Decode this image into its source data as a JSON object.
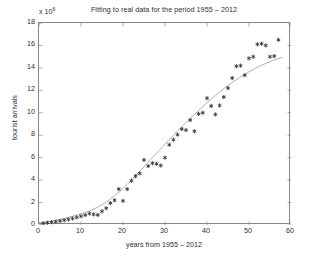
{
  "chart_data": {
    "type": "scatter",
    "title": "Fitting to real data for the period 1955 – 2012",
    "xlabel": "years from 1955 – 2012",
    "ylabel": "tourist arrivals",
    "y_multiplier": "x 10",
    "y_multiplier_exp": "6",
    "xlim": [
      0,
      60
    ],
    "ylim": [
      0,
      18
    ],
    "xticks": [
      0,
      10,
      20,
      30,
      40,
      50,
      60
    ],
    "yticks": [
      0,
      2,
      4,
      6,
      8,
      10,
      12,
      14,
      16,
      18
    ],
    "grid": false,
    "legend": "none",
    "marker_color": "#3a3a3a",
    "curve_color": "#9a9a9a",
    "axis_color": "#868686",
    "background": "#ffffff",
    "series": [
      {
        "name": "real data",
        "type": "scatter",
        "marker": "asterisk",
        "x": [
          1,
          2,
          3,
          4,
          5,
          6,
          7,
          8,
          9,
          10,
          11,
          12,
          13,
          14,
          15,
          16,
          17,
          18,
          19,
          20,
          21,
          22,
          23,
          24,
          25,
          26,
          27,
          28,
          29,
          30,
          31,
          32,
          33,
          34,
          35,
          36,
          37,
          38,
          39,
          40,
          41,
          42,
          43,
          44,
          45,
          46,
          47,
          48,
          49,
          50,
          51,
          52,
          53,
          54,
          55,
          56,
          57
        ],
        "y": [
          0.15,
          0.2,
          0.25,
          0.3,
          0.35,
          0.42,
          0.5,
          0.58,
          0.68,
          0.78,
          0.88,
          1.02,
          0.95,
          0.9,
          1.22,
          1.5,
          1.95,
          2.2,
          3.2,
          2.15,
          3.2,
          3.95,
          4.35,
          4.6,
          5.8,
          5.25,
          5.5,
          5.45,
          5.3,
          6.0,
          7.15,
          7.6,
          8.05,
          8.55,
          8.45,
          9.35,
          8.35,
          9.9,
          10.0,
          11.3,
          10.6,
          9.85,
          10.65,
          11.4,
          12.2,
          13.1,
          14.15,
          14.2,
          13.35,
          14.85,
          15.0,
          16.1,
          16.15,
          16.0,
          15.0,
          15.05,
          16.5
        ]
      },
      {
        "name": "fitted logistic curve",
        "type": "line",
        "x": [
          0,
          2,
          4,
          6,
          8,
          10,
          12,
          14,
          16,
          18,
          20,
          22,
          24,
          26,
          28,
          30,
          32,
          34,
          36,
          38,
          40,
          42,
          44,
          46,
          48,
          50,
          52,
          54,
          56,
          58
        ],
        "y": [
          0.18,
          0.28,
          0.42,
          0.58,
          0.78,
          1.0,
          1.25,
          1.6,
          2.05,
          2.6,
          3.25,
          4.0,
          4.8,
          5.6,
          6.4,
          7.2,
          8.0,
          8.75,
          9.5,
          10.2,
          10.9,
          11.55,
          12.15,
          12.7,
          13.2,
          13.65,
          14.05,
          14.4,
          14.7,
          14.95
        ]
      }
    ]
  }
}
